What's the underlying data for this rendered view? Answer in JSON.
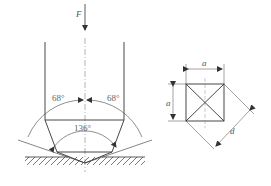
{
  "diagram": {
    "indenter": {
      "force_label": "F",
      "left_face_angle": "68°",
      "right_face_angle": "68°",
      "apex_angle": "136°"
    },
    "impression": {
      "side_label_top": "a",
      "side_label_left": "a",
      "diagonal_label": "d"
    },
    "colors": {
      "line": "#333333",
      "text": "#555555"
    }
  }
}
